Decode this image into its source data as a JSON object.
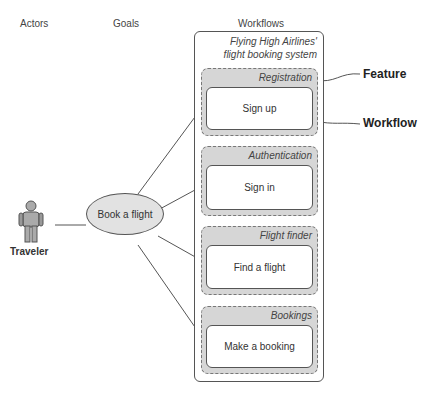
{
  "headers": {
    "actors": "Actors",
    "goals": "Goals",
    "workflows": "Workflows"
  },
  "system": {
    "line1": "Flying High Airlines'",
    "line2": "flight booking system"
  },
  "actor": {
    "label": "Traveler",
    "icon": "person-icon"
  },
  "goal": {
    "label": "Book a flight"
  },
  "features": [
    {
      "title": "Registration",
      "workflow": "Sign up"
    },
    {
      "title": "Authentication",
      "workflow": "Sign in"
    },
    {
      "title": "Flight finder",
      "workflow": "Find a flight"
    },
    {
      "title": "Bookings",
      "workflow": "Make a booking"
    }
  ],
  "callouts": {
    "feature": "Feature",
    "workflow": "Workflow"
  }
}
